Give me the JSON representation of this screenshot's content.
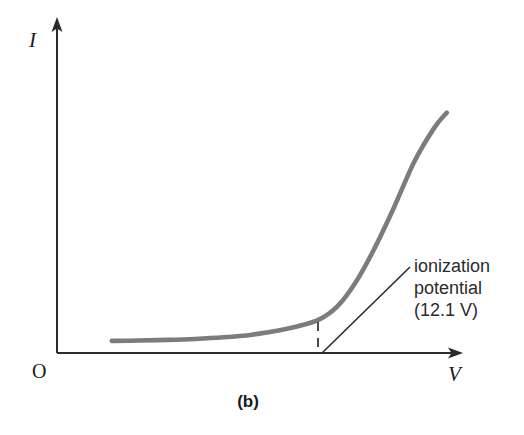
{
  "figure": {
    "caption": "(b)",
    "background_color": "#ffffff",
    "curve_color": "#7c7c7c",
    "axis_color": "#2b2b2b",
    "text_color": "#2b2b2b"
  },
  "axes": {
    "y_label": "I",
    "x_label": "V",
    "origin_label": "O"
  },
  "annotation": {
    "line1": "ionization",
    "line2": "potential",
    "line3": "(12.1 V)"
  },
  "chart_data": {
    "type": "line",
    "title": "",
    "subtitle": "",
    "xlabel": "V",
    "ylabel": "I",
    "grid": false,
    "legend": null,
    "axis_style": "arrow-axes",
    "xlim": [
      0,
      1
    ],
    "ylim": [
      0,
      1
    ],
    "annotations": [
      {
        "text": "ionization potential (12.1 V)",
        "value": 12.1,
        "unit": "V",
        "marker": "dashed-vertical",
        "x_at_marker": 0.645
      }
    ],
    "series": [
      {
        "name": "current vs voltage",
        "color": "#7c7c7c",
        "x": [
          0.135,
          0.2,
          0.27,
          0.34,
          0.41,
          0.48,
          0.545,
          0.6,
          0.645,
          0.69,
          0.735,
          0.78,
          0.83,
          0.88,
          0.93,
          0.96
        ],
        "y": [
          0.037,
          0.038,
          0.04,
          0.043,
          0.048,
          0.056,
          0.069,
          0.084,
          0.102,
          0.142,
          0.215,
          0.315,
          0.445,
          0.585,
          0.69,
          0.735
        ]
      }
    ]
  }
}
